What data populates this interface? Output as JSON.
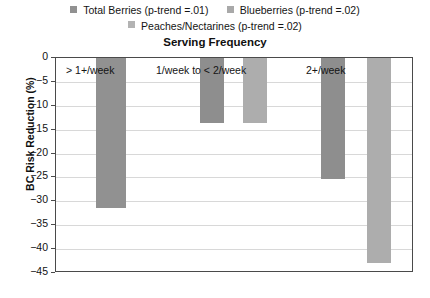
{
  "chart_data": {
    "type": "bar",
    "title": "Serving Frequency",
    "xlabel": "",
    "ylabel": "BC Risk Reduction (%)",
    "ylim": [
      -45,
      0
    ],
    "ytick_values": [
      0,
      -5,
      -10,
      -15,
      -20,
      -25,
      -30,
      -35,
      -40,
      -45
    ],
    "ytick_labels": [
      "0",
      "−5",
      "−10",
      "−15",
      "−20",
      "−25",
      "−30",
      "−35",
      "−40",
      "−45"
    ],
    "grid": true,
    "legend_position": "top",
    "categories": [
      "> 1+/week",
      "1/week to < 2/week",
      "2+/week"
    ],
    "series": [
      {
        "name": "Total Berries (p-trend =.01)",
        "color": "#919191",
        "values": [
          -31.3,
          -13.6,
          -25.4
        ]
      },
      {
        "name": "Blueberries (p-trend =.02)",
        "color": "#a9a9a9",
        "values": [
          null,
          -13.6,
          -43.0
        ]
      },
      {
        "name": "Peaches/Nectarines (p-trend =.02)",
        "color": "#b3b3b3",
        "values": [
          null,
          null,
          null
        ]
      }
    ]
  },
  "legend": {
    "row1": [
      {
        "label": "Total Berries (p-trend =.01)",
        "color": "#919191"
      },
      {
        "label": "Blueberries (p-trend =.02)",
        "color": "#a9a9a9"
      }
    ],
    "row2": [
      {
        "label": "Peaches/Nectarines (p-trend =.02)",
        "color": "#b3b3b3"
      }
    ]
  },
  "bars": [
    {
      "name": "bar-total-berries-gt1week",
      "series": "Total Berries (p-trend =.01)",
      "category": "> 1+/week",
      "value": -31.3,
      "color": "#919191",
      "left": 40,
      "width": 30
    },
    {
      "name": "bar-total-berries-1to2week",
      "series": "Total Berries (p-trend =.01)",
      "category": "1/week to < 2/week",
      "value": -13.6,
      "color": "#8e8e8e",
      "left": 144,
      "width": 24
    },
    {
      "name": "bar-blueberries-1to2week",
      "series": "Blueberries (p-trend =.02)",
      "category": "1/week to < 2/week",
      "value": -13.6,
      "color": "#adadad",
      "left": 187,
      "width": 24
    },
    {
      "name": "bar-total-berries-2plusweek",
      "series": "Total Berries (p-trend =.01)",
      "category": "2+/week",
      "value": -25.4,
      "color": "#8e8e8e",
      "left": 265,
      "width": 24
    },
    {
      "name": "bar-blueberries-2plusweek",
      "series": "Blueberries (p-trend =.02)",
      "category": "2+/week",
      "value": -43.0,
      "color": "#adadad",
      "left": 311,
      "width": 24
    }
  ],
  "category_labels": [
    {
      "text": "> 1+/week",
      "left": 10,
      "top": 6
    },
    {
      "text": "1/week to < 2/week",
      "left": 100,
      "top": 6
    },
    {
      "text": "2+/week",
      "left": 250,
      "top": 6
    }
  ]
}
